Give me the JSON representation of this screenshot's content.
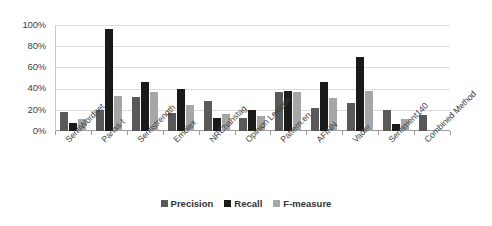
{
  "chart_data": {
    "type": "bar",
    "title": "",
    "xlabel": "",
    "ylabel": "",
    "ylim": [
      0,
      100
    ],
    "ytick_labels": [
      "100%",
      "80%",
      "60%",
      "40%",
      "20%",
      "0%"
    ],
    "ytick_values": [
      100,
      80,
      60,
      40,
      20,
      0
    ],
    "grid": true,
    "legend_position": "bottom",
    "categories": [
      "SentiWordnet",
      "Panas-t",
      "Sentistrength",
      "Emolex",
      "NRChahstag",
      "Opinion Lexicon",
      "Pattern.en",
      "AFINN",
      "Vader",
      "Sentiment140",
      "Combined Method"
    ],
    "series": [
      {
        "name": "Precision",
        "color": "#595959",
        "values": [
          18,
          20,
          32,
          17,
          28,
          12,
          37,
          22,
          26,
          20,
          15
        ]
      },
      {
        "name": "Recall",
        "color": "#1a1a1a",
        "values": [
          8,
          96,
          46,
          40,
          12,
          20,
          38,
          46,
          70,
          7,
          0
        ]
      },
      {
        "name": "F-measure",
        "color": "#a6a6a6",
        "values": [
          11,
          33,
          37,
          25,
          16,
          14,
          37,
          31,
          38,
          11,
          0
        ]
      }
    ]
  }
}
